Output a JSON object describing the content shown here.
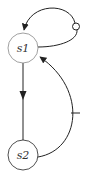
{
  "diagram": {
    "type": "state-transition",
    "nodes": [
      {
        "id": "s1",
        "label": "s1"
      },
      {
        "id": "s2",
        "label": "s2"
      }
    ],
    "edges": [
      {
        "from": "s1",
        "to": "s1",
        "kind": "self-loop",
        "marker": "small-circle"
      },
      {
        "from": "s1",
        "to": "s2",
        "kind": "straight"
      },
      {
        "from": "s2",
        "to": "s1",
        "kind": "curved",
        "marker": "tick"
      }
    ],
    "colors": {
      "node_stroke": "#888888",
      "edge": "#222222",
      "label": "#333333"
    }
  }
}
